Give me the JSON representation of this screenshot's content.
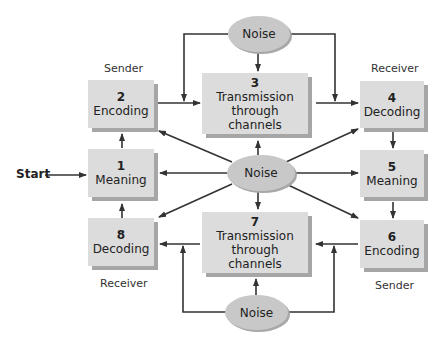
{
  "diagram": {
    "start_label": "Start",
    "role_labels": {
      "sender_top": "Sender",
      "receiver_top": "Receiver",
      "receiver_bottom": "Receiver",
      "sender_bottom": "Sender"
    },
    "steps": [
      {
        "number": "1",
        "label": "Meaning"
      },
      {
        "number": "2",
        "label": "Encoding"
      },
      {
        "number": "3",
        "label": "Transmission through channels"
      },
      {
        "number": "4",
        "label": "Decoding"
      },
      {
        "number": "5",
        "label": "Meaning"
      },
      {
        "number": "6",
        "label": "Encoding"
      },
      {
        "number": "7",
        "label": "Transmission through channels"
      },
      {
        "number": "8",
        "label": "Decoding"
      }
    ],
    "noise": {
      "top": "Noise",
      "center": "Noise",
      "bottom": "Noise"
    },
    "colors": {
      "box_face": "#dcdcdc",
      "box_shadow": "#a6a6a6",
      "ellipse": "#c8c8c8",
      "arrow": "#333333"
    }
  }
}
